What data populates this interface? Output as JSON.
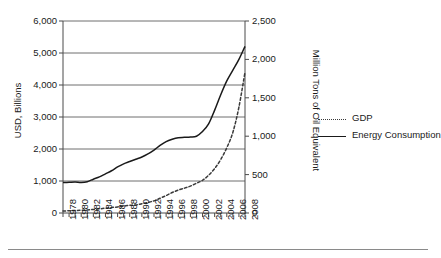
{
  "chart_data": {
    "type": "line",
    "title": "",
    "subtitle": "",
    "xlabel": "",
    "ylabel": "USD, Billions",
    "ylabel_right": "Million Tons of Oil Equivalent",
    "grid": "horizontal",
    "legend_position": "right",
    "xlim": [
      1978,
      2008
    ],
    "ylim": [
      0,
      6000
    ],
    "ylim_right": [
      0,
      2500
    ],
    "yticks": [
      0,
      1000,
      2000,
      3000,
      4000,
      5000,
      6000
    ],
    "ytick_labels": [
      "0",
      "1,000",
      "2,000",
      "3,000",
      "4,000",
      "5,000",
      "6,000"
    ],
    "yticks_right": [
      0,
      500,
      1000,
      1500,
      2000,
      2500
    ],
    "ytick_labels_right": [
      "0",
      "500",
      "1,000",
      "1,500",
      "2,000",
      "2,500"
    ],
    "x": [
      1978,
      1979,
      1980,
      1981,
      1982,
      1983,
      1984,
      1985,
      1986,
      1987,
      1988,
      1989,
      1990,
      1991,
      1992,
      1993,
      1994,
      1995,
      1996,
      1997,
      1998,
      1999,
      2000,
      2001,
      2002,
      2003,
      2004,
      2005,
      2006,
      2007,
      2008
    ],
    "xtick_labels": [
      "1978",
      "1980",
      "1982",
      "1984",
      "1986",
      "1988",
      "1990",
      "1992",
      "1994",
      "1996",
      "1998",
      "2000",
      "2002",
      "2004",
      "2006",
      "2008"
    ],
    "series": [
      {
        "name": "GDP",
        "axis": "left",
        "units": "USD, Billions",
        "style": "dashed",
        "color": "#3a3a3a",
        "values": [
          60,
          70,
          80,
          85,
          95,
          110,
          130,
          150,
          170,
          190,
          215,
          240,
          250,
          290,
          330,
          380,
          460,
          545,
          640,
          715,
          775,
          840,
          930,
          1020,
          1180,
          1390,
          1670,
          2040,
          2520,
          3310,
          4400
        ]
      },
      {
        "name": "Energy Consumption",
        "axis": "right",
        "units": "Million Tons of Oil Equivalent",
        "style": "solid",
        "color": "#1a1a1a",
        "values": [
          396,
          400,
          404,
          398,
          408,
          440,
          470,
          510,
          550,
          600,
          640,
          670,
          700,
          730,
          770,
          820,
          880,
          930,
          960,
          980,
          985,
          990,
          1000,
          1060,
          1160,
          1340,
          1540,
          1720,
          1860,
          2000,
          2170
        ]
      }
    ],
    "legend": [
      {
        "label": "GDP",
        "style": "dashed"
      },
      {
        "label": "Energy Consumption",
        "style": "solid"
      }
    ]
  }
}
